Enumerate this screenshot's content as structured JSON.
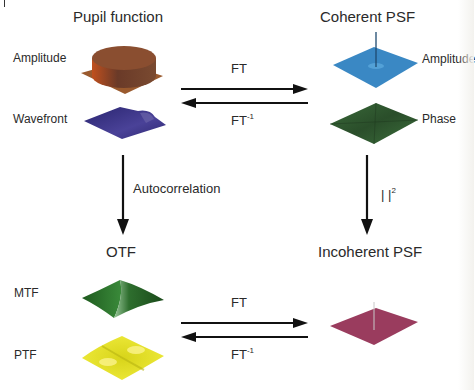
{
  "nodes": {
    "pupil_function": {
      "title": "Pupil function",
      "components": [
        {
          "label": "Amplitude",
          "color": "#8a4a2a"
        },
        {
          "label": "Wavefront",
          "color": "#3b3480"
        }
      ]
    },
    "coherent_psf": {
      "title": "Coherent PSF",
      "components": [
        {
          "label": "Amplitude",
          "color": "#3a86c0"
        },
        {
          "label": "Phase",
          "color": "#2f5a2f"
        }
      ]
    },
    "otf": {
      "title": "OTF",
      "components": [
        {
          "label": "MTF",
          "color": "#2e7a2e"
        },
        {
          "label": "PTF",
          "color": "#e5e02a"
        }
      ]
    },
    "incoherent_psf": {
      "title": "Incoherent PSF",
      "components": [
        {
          "label": "",
          "color": "#9a3a5a"
        }
      ]
    }
  },
  "edges": {
    "top_forward": {
      "label": "FT",
      "from": "Pupil function",
      "to": "Coherent PSF"
    },
    "top_inverse": {
      "label": "FT",
      "sup": "-1",
      "from": "Coherent PSF",
      "to": "Pupil function"
    },
    "left_down": {
      "label": "Autocorrelation",
      "from": "Pupil function",
      "to": "OTF"
    },
    "right_down": {
      "label": "|  |",
      "sup": "2",
      "from": "Coherent PSF",
      "to": "Incoherent PSF"
    },
    "bottom_forward": {
      "label": "FT",
      "from": "OTF",
      "to": "Incoherent PSF"
    },
    "bottom_inverse": {
      "label": "FT",
      "sup": "-1",
      "from": "Incoherent PSF",
      "to": "OTF"
    }
  }
}
